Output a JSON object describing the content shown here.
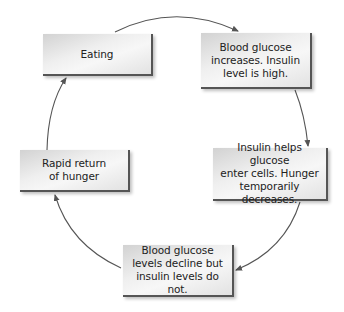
{
  "diagram": {
    "type": "cycle",
    "nodes": [
      {
        "id": "eating",
        "label": "Eating"
      },
      {
        "id": "glucose-increases",
        "label": "Blood glucose\nincreases. Insulin\nlevel is high."
      },
      {
        "id": "insulin-helps",
        "label": "Insulin helps glucose\nenter cells. Hunger\ntemporarily decreases."
      },
      {
        "id": "glucose-declines",
        "label": "Blood glucose\nlevels decline but\ninsulin levels do not."
      },
      {
        "id": "hunger-returns",
        "label": "Rapid return\nof hunger"
      }
    ],
    "edges": [
      {
        "from": "eating",
        "to": "glucose-increases"
      },
      {
        "from": "glucose-increases",
        "to": "insulin-helps"
      },
      {
        "from": "insulin-helps",
        "to": "glucose-declines"
      },
      {
        "from": "glucose-declines",
        "to": "hunger-returns"
      },
      {
        "from": "hunger-returns",
        "to": "eating"
      }
    ],
    "colors": {
      "arrow": "#555555",
      "box_border": "#555555",
      "text": "#222222"
    }
  }
}
